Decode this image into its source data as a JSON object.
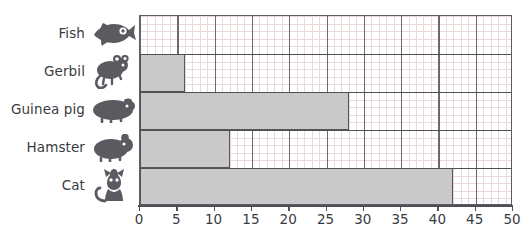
{
  "chart_data": {
    "type": "bar",
    "orientation": "horizontal",
    "title": "",
    "subtitle": "",
    "xlabel": "",
    "ylabel": "",
    "categories": [
      "Fish",
      "Gerbil",
      "Guinea pig",
      "Hamster",
      "Cat"
    ],
    "values": [
      0,
      6,
      28,
      12,
      42
    ],
    "xlim": [
      0,
      50
    ],
    "xticks": [
      0,
      5,
      10,
      15,
      20,
      25,
      30,
      35,
      40,
      45,
      50
    ],
    "xtick_labels": [
      "0",
      "5",
      "10",
      "15",
      "20",
      "25",
      "30",
      "35",
      "40",
      "45",
      "50"
    ],
    "minor_tick_step": 1,
    "grid": true,
    "grid_minor": true,
    "legend": false,
    "legend_position": "none",
    "bar_fill_color": "#c9c9c9",
    "bar_border_color": "#55555b",
    "grid_minor_color": "#e9d9d9",
    "grid_major_color": "#6a6a70",
    "axis_color": "#4e4e54",
    "label_color": "#3b3b42",
    "icon_color": "#5a5a60",
    "series": [
      {
        "name": "",
        "values": [
          0,
          6,
          28,
          12,
          42
        ]
      }
    ],
    "points": [
      {
        "category": "Fish",
        "value": 0,
        "icon": "fish-icon"
      },
      {
        "category": "Gerbil",
        "value": 6,
        "icon": "gerbil-icon"
      },
      {
        "category": "Guinea pig",
        "value": 28,
        "icon": "guinea-pig-icon"
      },
      {
        "category": "Hamster",
        "value": 12,
        "icon": "hamster-icon"
      },
      {
        "category": "Cat",
        "value": 42,
        "icon": "cat-icon"
      }
    ]
  }
}
